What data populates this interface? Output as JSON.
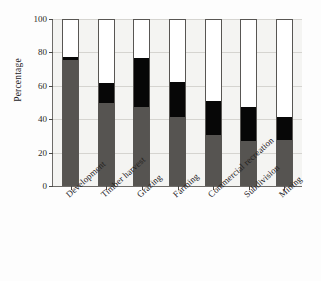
{
  "chart_data": {
    "type": "bar",
    "subtype": "stacked-bar-100",
    "title": "",
    "xlabel": "",
    "ylabel": "Percentage",
    "ylim": [
      0,
      100
    ],
    "yticks": [
      0,
      20,
      40,
      60,
      80,
      100
    ],
    "ytick_labels": [
      "0",
      "20",
      "40",
      "60",
      "80",
      "100"
    ],
    "grid": true,
    "legend": "none",
    "categories": [
      "Development",
      "Timber harvest",
      "Grazing",
      "Farming",
      "Commercial recreation",
      "Subdivision",
      "Mining"
    ],
    "series": [
      {
        "name": "lower-segment",
        "color": "#565451",
        "values": [
          75,
          49,
          46.5,
          41,
          30,
          26.5,
          27
        ]
      },
      {
        "name": "middle-segment",
        "color": "#070707",
        "values": [
          3,
          13,
          30.5,
          22,
          21.5,
          21.5,
          15
        ]
      },
      {
        "name": "upper-segment",
        "color": "#ffffff",
        "values": [
          22,
          38,
          23,
          37,
          48.5,
          52,
          58
        ]
      }
    ],
    "cumulative_tops": {
      "lower": [
        75,
        49,
        46.5,
        41,
        30,
        26.5,
        27
      ],
      "middle": [
        78,
        62,
        77,
        63,
        51.5,
        48,
        42
      ],
      "upper": [
        100,
        100,
        100,
        100,
        100,
        100,
        100
      ]
    },
    "axis_colors": {
      "frame": "#6d6b68",
      "grid": "#d5d4d0",
      "plot_background": "#f4f4f2",
      "text": "#24221f"
    }
  }
}
